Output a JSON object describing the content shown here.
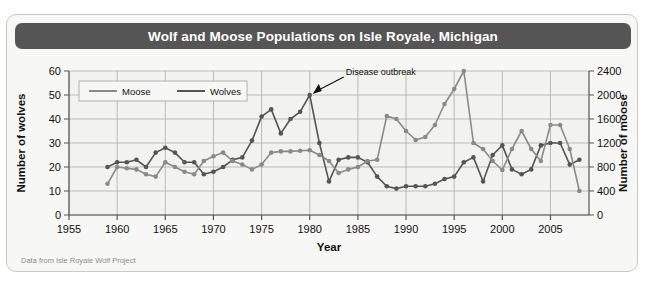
{
  "title": "Wolf and  Moose Populations on Isle Royale, Michigan",
  "footer": "Data from Isle Royale Wolf Project",
  "colors": {
    "titlebar": "#555555",
    "card_bg": "#f7f7f5",
    "plot_bg": "#f2f2ef",
    "grid": "#b4b4b0",
    "moose": "#8a8a8a",
    "wolves": "#555555"
  },
  "legend": {
    "position": "top-left-inside",
    "entries": [
      {
        "label": "Moose",
        "color": "#8a8a8a"
      },
      {
        "label": "Wolves",
        "color": "#555555"
      }
    ]
  },
  "annotation": {
    "text": "Disease outbreak",
    "points_to_year": 1980,
    "points_to_wolves": 50
  },
  "chart_data": {
    "type": "line",
    "title": "Wolf and  Moose Populations on Isle Royale, Michigan",
    "xlabel": "Year",
    "ylabel": "Number of wolves",
    "y2label": "Number of moose",
    "xlim": [
      1955,
      2009
    ],
    "ylim": [
      0,
      60
    ],
    "y2lim": [
      0,
      2400
    ],
    "xticks": [
      1955,
      1960,
      1965,
      1970,
      1975,
      1980,
      1985,
      1990,
      1995,
      2000,
      2005
    ],
    "yticks": [
      0,
      10,
      20,
      30,
      40,
      50,
      60
    ],
    "y2ticks": [
      0,
      400,
      800,
      1200,
      1600,
      2000,
      2400
    ],
    "grid": true,
    "legend_position": "upper left",
    "series": [
      {
        "name": "Wolves",
        "axis": "left",
        "color": "#555555",
        "x": [
          1959,
          1960,
          1961,
          1962,
          1963,
          1964,
          1965,
          1966,
          1967,
          1968,
          1969,
          1970,
          1971,
          1972,
          1973,
          1974,
          1975,
          1976,
          1977,
          1978,
          1979,
          1980,
          1981,
          1982,
          1983,
          1984,
          1985,
          1986,
          1987,
          1988,
          1989,
          1990,
          1991,
          1992,
          1993,
          1994,
          1995,
          1996,
          1997,
          1998,
          1999,
          2000,
          2001,
          2002,
          2003,
          2004,
          2005,
          2006,
          2007,
          2008
        ],
        "values": [
          20,
          22,
          22,
          23,
          20,
          26,
          28,
          26,
          22,
          22,
          17,
          18,
          20,
          23,
          24,
          31,
          41,
          44,
          34,
          40,
          43,
          50,
          30,
          14,
          23,
          24,
          24,
          22,
          16,
          12,
          11,
          12,
          12,
          12,
          13,
          15,
          16,
          22,
          24,
          14,
          25,
          29,
          19,
          17,
          19,
          29,
          30,
          30,
          21,
          23
        ]
      },
      {
        "name": "Moose",
        "axis": "right",
        "color": "#8a8a8a",
        "x": [
          1959,
          1960,
          1961,
          1962,
          1963,
          1964,
          1965,
          1966,
          1967,
          1968,
          1969,
          1970,
          1971,
          1972,
          1973,
          1974,
          1975,
          1976,
          1977,
          1978,
          1979,
          1980,
          1981,
          1982,
          1983,
          1984,
          1985,
          1986,
          1987,
          1988,
          1989,
          1990,
          1991,
          1992,
          1993,
          1994,
          1995,
          1996,
          1997,
          1998,
          1999,
          2000,
          2001,
          2002,
          2003,
          2004,
          2005,
          2006,
          2007,
          2008
        ],
        "values": [
          520,
          800,
          780,
          760,
          680,
          640,
          880,
          800,
          720,
          680,
          900,
          980,
          1040,
          900,
          840,
          760,
          840,
          1040,
          1060,
          1060,
          1070,
          1080,
          1000,
          900,
          700,
          760,
          800,
          900,
          920,
          1650,
          1600,
          1400,
          1250,
          1300,
          1500,
          1850,
          2100,
          2400,
          1200,
          1100,
          900,
          750,
          1100,
          1400,
          1100,
          900,
          1500,
          1500,
          1100,
          400
        ]
      }
    ]
  }
}
